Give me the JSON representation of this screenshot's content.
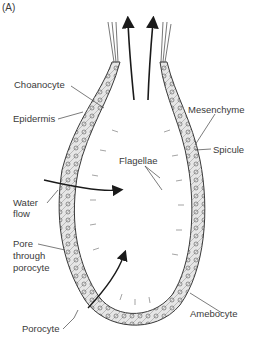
{
  "panel_label": "(A)",
  "labels": {
    "choanocyte": "Choanocyte",
    "epidermis": "Epidermis",
    "mesenchyme": "Mesenchyme",
    "spicule": "Spicule",
    "flagellae": "Flagellae",
    "water_flow_1": "Water",
    "water_flow_2": "flow",
    "pore_1": "Pore",
    "pore_2": "through",
    "pore_3": "porocyte",
    "amebocyte": "Amebocyte",
    "porocyte": "Porocyte"
  },
  "colors": {
    "line": "#3a3a3a",
    "wall_fill": "#d8d8d8",
    "arrow": "#1a1a1a"
  }
}
